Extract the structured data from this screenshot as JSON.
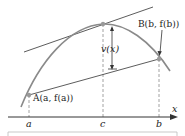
{
  "diagram": {
    "colors": {
      "curve": "#8a8a8a",
      "lines": "#4a4a4a",
      "axis": "#333333",
      "dashed": "#8a8a8a",
      "points": "#9a9a9a"
    },
    "points": {
      "A": {
        "label": "A(a, f(a))"
      },
      "B": {
        "label": "B(b, f(b))"
      }
    },
    "axis": {
      "x_label": "x",
      "ticks": [
        "a",
        "c",
        "b"
      ]
    },
    "annotation": {
      "vertical_distance": "v(x)"
    }
  }
}
